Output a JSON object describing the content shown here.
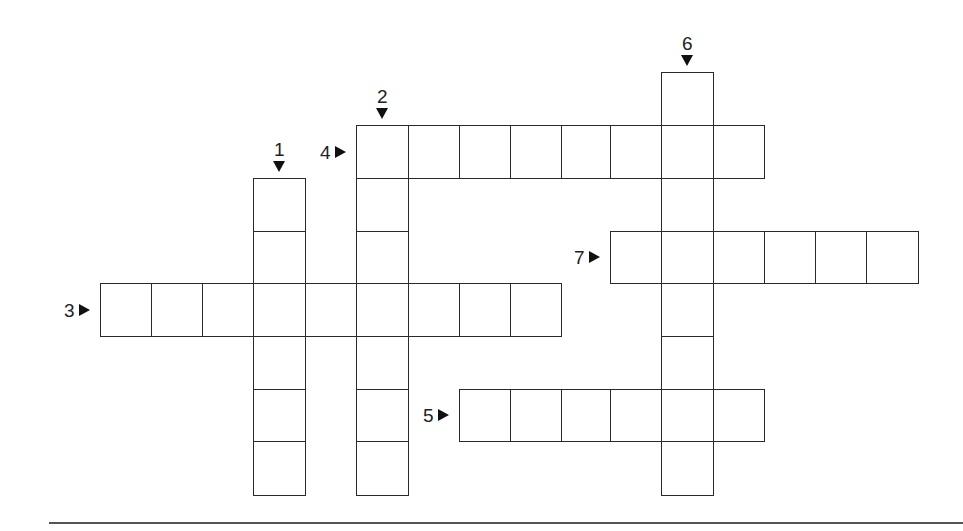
{
  "puzzle": {
    "type": "crossword",
    "entries": [
      {
        "number": "1",
        "direction": "down",
        "length": 6,
        "col": 3,
        "row": 2
      },
      {
        "number": "2",
        "direction": "down",
        "length": 7,
        "col": 5,
        "row": 1
      },
      {
        "number": "3",
        "direction": "across",
        "length": 9,
        "col": 0,
        "row": 4
      },
      {
        "number": "4",
        "direction": "across",
        "length": 8,
        "col": 5,
        "row": 1
      },
      {
        "number": "5",
        "direction": "across",
        "length": 6,
        "col": 7,
        "row": 6
      },
      {
        "number": "6",
        "direction": "down",
        "length": 8,
        "col": 11,
        "row": 0
      },
      {
        "number": "7",
        "direction": "across",
        "length": 6,
        "col": 10,
        "row": 3
      }
    ],
    "grid": {
      "col_x": [
        100,
        151,
        202,
        253,
        305,
        356,
        408,
        459,
        510,
        561,
        610,
        661,
        713,
        764,
        815,
        866,
        918
      ],
      "row_y": [
        72,
        125,
        178,
        231,
        283,
        336,
        389,
        441,
        495
      ]
    },
    "colors": {
      "line": "#2a2a2a",
      "background": "#ffffff"
    }
  }
}
